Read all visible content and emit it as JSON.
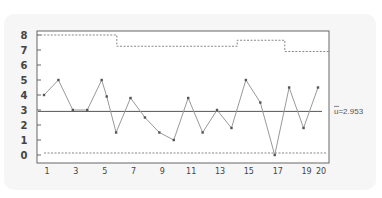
{
  "chart_data": {
    "type": "line",
    "title": "",
    "subtitle": "u control chart",
    "xlabel": "",
    "ylabel": "",
    "ylim": [
      0,
      8
    ],
    "grid": false,
    "x": [
      1,
      2,
      3,
      4,
      5,
      6,
      7,
      8,
      9,
      10,
      11,
      12,
      13,
      14,
      15,
      16,
      17,
      18,
      19,
      20
    ],
    "x_tick_labels": [
      "1",
      "3",
      "5",
      "7",
      "9",
      "11",
      "13",
      "15",
      "17",
      "19",
      "20"
    ],
    "x_tick_positions": [
      1,
      3,
      5,
      7,
      9,
      11,
      13,
      15,
      17,
      19,
      20
    ],
    "y_tick_labels": [
      "0",
      "1",
      "2",
      "3",
      "4",
      "5",
      "6",
      "7",
      "8"
    ],
    "series": [
      {
        "name": "u",
        "values": [
          4.0,
          5.0,
          3.0,
          3.0,
          5.0,
          1.5,
          3.8,
          2.5,
          1.5,
          1.0,
          3.8,
          1.5,
          3.0,
          1.8,
          5.0,
          3.5,
          0.0,
          4.5,
          1.8,
          4.5
        ],
        "extra_marker": {
          "x": 5.35,
          "value": 3.9
        }
      }
    ],
    "center_line": {
      "value": 2.953,
      "label": "u=2.953",
      "bar_symbol": "u"
    },
    "ucl_steps": [
      {
        "from": 0.5,
        "to": 6.05,
        "value": 8.0
      },
      {
        "from": 6.05,
        "to": 14.4,
        "value": 7.25
      },
      {
        "from": 14.4,
        "to": 17.7,
        "value": 7.65
      },
      {
        "from": 17.7,
        "to": 20.8,
        "value": 6.9
      }
    ],
    "lcl": {
      "value": 0.1
    },
    "colors": {
      "data_line": "#999999",
      "marker": "#555555",
      "center_line": "#555555",
      "limit_line": "#888888",
      "frame": "#666666"
    }
  }
}
